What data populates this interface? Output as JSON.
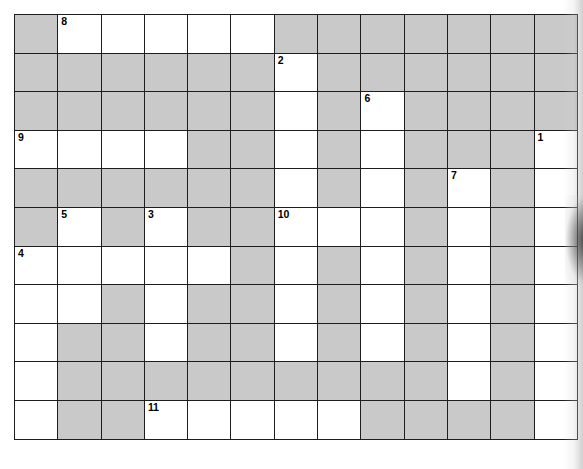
{
  "document": {
    "kind": "crossword-puzzle-grid",
    "title": "Crossword Puzzle Grid",
    "columns": 13,
    "rows": 11
  },
  "colors": {
    "blocked_cell": "#c9c9c9",
    "open_cell": "#ffffff",
    "grid_line": "#1d1d1d",
    "number_text": "#000000",
    "page_background": "#ffffff"
  },
  "legend": {
    "open_label": "open cell",
    "blocked_label": "blocked cell"
  },
  "clue_numbers": [
    {
      "number": "8",
      "row": 0,
      "col": 1
    },
    {
      "number": "2",
      "row": 1,
      "col": 6
    },
    {
      "number": "6",
      "row": 2,
      "col": 8
    },
    {
      "number": "9",
      "row": 3,
      "col": 0
    },
    {
      "number": "1",
      "row": 3,
      "col": 12
    },
    {
      "number": "7",
      "row": 4,
      "col": 10
    },
    {
      "number": "5",
      "row": 5,
      "col": 1
    },
    {
      "number": "3",
      "row": 5,
      "col": 3
    },
    {
      "number": "10",
      "row": 5,
      "col": 6
    },
    {
      "number": "4",
      "row": 6,
      "col": 0
    },
    {
      "number": "11",
      "row": 10,
      "col": 3
    }
  ],
  "grid": [
    [
      "blocked",
      "open",
      "open",
      "open",
      "open",
      "open",
      "blocked",
      "blocked",
      "blocked",
      "blocked",
      "blocked",
      "blocked",
      "blocked"
    ],
    [
      "blocked",
      "blocked",
      "blocked",
      "blocked",
      "blocked",
      "blocked",
      "open",
      "blocked",
      "blocked",
      "blocked",
      "blocked",
      "blocked",
      "blocked"
    ],
    [
      "blocked",
      "blocked",
      "blocked",
      "blocked",
      "blocked",
      "blocked",
      "open",
      "blocked",
      "open",
      "blocked",
      "blocked",
      "blocked",
      "blocked"
    ],
    [
      "open",
      "open",
      "open",
      "open",
      "blocked",
      "blocked",
      "open",
      "blocked",
      "open",
      "blocked",
      "blocked",
      "blocked",
      "open"
    ],
    [
      "blocked",
      "blocked",
      "blocked",
      "blocked",
      "blocked",
      "blocked",
      "open",
      "blocked",
      "open",
      "blocked",
      "open",
      "blocked",
      "open"
    ],
    [
      "blocked",
      "open",
      "blocked",
      "open",
      "blocked",
      "blocked",
      "open",
      "open",
      "open",
      "blocked",
      "open",
      "blocked",
      "open"
    ],
    [
      "open",
      "open",
      "open",
      "open",
      "open",
      "blocked",
      "open",
      "blocked",
      "open",
      "blocked",
      "open",
      "blocked",
      "open"
    ],
    [
      "open",
      "open",
      "blocked",
      "open",
      "blocked",
      "blocked",
      "open",
      "blocked",
      "open",
      "blocked",
      "open",
      "blocked",
      "open"
    ],
    [
      "open",
      "blocked",
      "blocked",
      "open",
      "blocked",
      "blocked",
      "open",
      "blocked",
      "open",
      "blocked",
      "open",
      "blocked",
      "open"
    ],
    [
      "open",
      "blocked",
      "blocked",
      "blocked",
      "blocked",
      "blocked",
      "blocked",
      "blocked",
      "blocked",
      "blocked",
      "open",
      "blocked",
      "open"
    ],
    [
      "open",
      "blocked",
      "blocked",
      "open",
      "open",
      "open",
      "open",
      "open",
      "blocked",
      "blocked",
      "blocked",
      "blocked",
      "open"
    ]
  ]
}
